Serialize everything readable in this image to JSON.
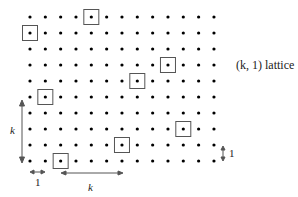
{
  "title": "(k, 1) lattice",
  "grid": {
    "cols": 13,
    "rows": 10,
    "x0": 30,
    "dx": 15.33,
    "y0": 17,
    "dy": 16
  },
  "boxes": [
    {
      "row": 0,
      "col": 4
    },
    {
      "row": 1,
      "col": 0
    },
    {
      "row": 3,
      "col": 9
    },
    {
      "row": 4,
      "col": 7
    },
    {
      "row": 5,
      "col": 1
    },
    {
      "row": 7,
      "col": 10
    },
    {
      "row": 8,
      "col": 6
    },
    {
      "row": 9,
      "col": 2
    }
  ],
  "labels": {
    "vertical_k": "k",
    "horizontal_k": "k",
    "horizontal_1": "1",
    "vertical_1": "1"
  },
  "colors": {
    "dot": "#000000",
    "box": "#555555",
    "arrow": "#555555"
  }
}
